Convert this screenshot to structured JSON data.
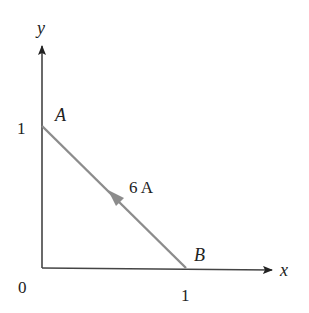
{
  "diagram": {
    "axes": {
      "x_label": "x",
      "y_label": "y",
      "origin_label": "0",
      "x_tick_label": "1",
      "y_tick_label": "1"
    },
    "points": {
      "A": {
        "label": "A",
        "coords": [
          0,
          1
        ]
      },
      "B": {
        "label": "B",
        "coords": [
          1,
          0
        ]
      }
    },
    "wire": {
      "current_label": "6 A",
      "direction": "from B to A",
      "color": "#8c8c8c"
    },
    "axis_color": "#333333"
  }
}
